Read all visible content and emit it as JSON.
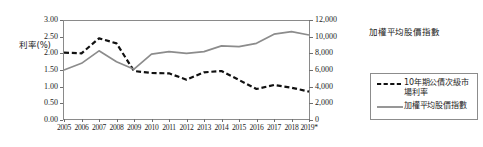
{
  "chart_data": {
    "type": "line",
    "title": "",
    "xlabel": "",
    "ylabel": "利率(%)",
    "y2label": "加權平均股價指數",
    "grid": false,
    "legend_position": "right",
    "x": [
      "2005",
      "2006",
      "2007",
      "2008",
      "2009",
      "2010",
      "2011",
      "2012",
      "2013",
      "2014",
      "2015",
      "2016",
      "2017",
      "2018",
      "2019*"
    ],
    "categories": [
      "2005",
      "2006",
      "2007",
      "2008",
      "2009",
      "2010",
      "2011",
      "2012",
      "2013",
      "2014",
      "2015",
      "2016",
      "2017",
      "2018",
      "2019*"
    ],
    "ylim": [
      0.0,
      3.0
    ],
    "y2lim": [
      0,
      12000
    ],
    "yticks": [
      "0.00",
      "0.50",
      "1.00",
      "1.50",
      "2.00",
      "2.50",
      "3.00"
    ],
    "ytick_values": [
      0.0,
      0.5,
      1.0,
      1.5,
      2.0,
      2.5,
      3.0
    ],
    "y2ticks": [
      "0",
      "2,000",
      "4,000",
      "6,000",
      "8,000",
      "10,000",
      "12,000"
    ],
    "y2tick_values": [
      0,
      2000,
      4000,
      6000,
      8000,
      10000,
      12000
    ],
    "series": [
      {
        "name": "10年期公債次級市場利率",
        "axis": "left",
        "style": "dashed",
        "color": "#111111",
        "values": [
          2.02,
          2.0,
          2.45,
          2.3,
          1.47,
          1.41,
          1.4,
          1.21,
          1.43,
          1.47,
          1.2,
          0.93,
          1.05,
          0.97,
          0.85
        ]
      },
      {
        "name": "加權平均股價指數",
        "axis": "right",
        "style": "solid",
        "color": "#8c8c8c",
        "values": [
          6000,
          6800,
          8300,
          7000,
          6100,
          7900,
          8200,
          8000,
          8200,
          8900,
          8800,
          9200,
          10300,
          10600,
          10200
        ]
      }
    ]
  },
  "axes": {
    "left_title": "利率(%)",
    "right_title": "加權平均股價指數"
  },
  "legend": {
    "items": [
      {
        "label": "10年期公債次級市場利率",
        "style": "dashed",
        "color": "#111111"
      },
      {
        "label": "加權平均股價指數",
        "style": "solid",
        "color": "#8c8c8c"
      }
    ]
  }
}
